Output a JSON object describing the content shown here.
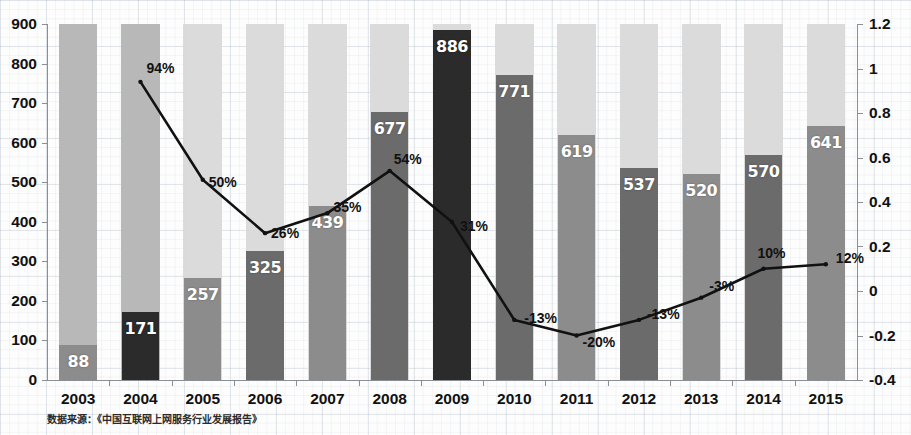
{
  "chart_data": {
    "type": "bar",
    "title": "",
    "subtitle": "",
    "xlabel": "",
    "ylabel": "",
    "grid": true,
    "legend": "none",
    "categories": [
      "2003",
      "2004",
      "2005",
      "2006",
      "2007",
      "2008",
      "2009",
      "2010",
      "2011",
      "2012",
      "2013",
      "2014",
      "2015"
    ],
    "y_left": {
      "ticks": [
        "0",
        "100",
        "200",
        "300",
        "400",
        "500",
        "600",
        "700",
        "800",
        "900"
      ],
      "values": [
        0,
        100,
        200,
        300,
        400,
        500,
        600,
        700,
        800,
        900
      ],
      "ylim": [
        0,
        900
      ]
    },
    "y_right": {
      "ticks": [
        "-0.4",
        "-0.2",
        "0",
        "0.2",
        "0.4",
        "0.6",
        "0.8",
        "1",
        "1.2"
      ],
      "values": [
        -0.4,
        -0.2,
        0,
        0.2,
        0.4,
        0.6,
        0.8,
        1.0,
        1.2
      ],
      "ylim": [
        -0.4,
        1.2
      ]
    },
    "series": [
      {
        "name": "bars",
        "type": "bar",
        "axis": "left",
        "values": [
          88,
          171,
          257,
          325,
          439,
          677,
          886,
          771,
          619,
          537,
          520,
          570,
          641
        ],
        "labels": [
          "88",
          "171",
          "257",
          "325",
          "439",
          "677",
          "886",
          "771",
          "619",
          "537",
          "520",
          "570",
          "641"
        ]
      },
      {
        "name": "growth-rate",
        "type": "line",
        "axis": "right",
        "x": [
          "2004",
          "2005",
          "2006",
          "2007",
          "2008",
          "2009",
          "2010",
          "2011",
          "2012",
          "2013",
          "2014",
          "2015"
        ],
        "values": [
          0.94,
          0.5,
          0.26,
          0.35,
          0.54,
          0.31,
          -0.13,
          -0.2,
          -0.13,
          -0.03,
          0.1,
          0.12
        ],
        "labels": [
          "94%",
          "50%",
          "26%",
          "35%",
          "54%",
          "31%",
          "-13%",
          "-20%",
          "-13%",
          "-3%",
          "10%",
          "12%"
        ]
      }
    ],
    "source_note": "数据来源：《中国互联网上网服务行业发展报告》",
    "colors": {
      "line": "#111111",
      "bar_dark": "#2b2b2b",
      "bar_mid": "#6b6b6b",
      "bar_light": "#8c8c8c",
      "column_bg_dark": "#b4b4b4",
      "column_bg_light": "#d9d9d9",
      "axis": "#8a8f96",
      "text": "#111111",
      "label_text": "#ffffff"
    }
  }
}
